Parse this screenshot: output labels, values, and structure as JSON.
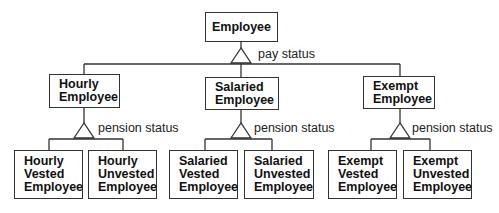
{
  "diagram": {
    "type": "generalization-hierarchy",
    "root": {
      "label_lines": [
        "Employee"
      ],
      "discriminator": "pay status"
    },
    "level1": [
      {
        "label_lines": [
          "Hourly",
          "Employee"
        ],
        "discriminator": "pension status",
        "children": [
          {
            "label_lines": [
              "Hourly",
              "Vested",
              "Employee"
            ]
          },
          {
            "label_lines": [
              "Hourly",
              "Unvested",
              "Employee"
            ]
          }
        ]
      },
      {
        "label_lines": [
          "Salaried",
          "Employee"
        ],
        "discriminator": "pension status",
        "children": [
          {
            "label_lines": [
              "Salaried",
              "Vested",
              "Employee"
            ]
          },
          {
            "label_lines": [
              "Salaried",
              "Unvested",
              "Employee"
            ]
          }
        ]
      },
      {
        "label_lines": [
          "Exempt",
          "Employee"
        ],
        "discriminator": "pension status",
        "children": [
          {
            "label_lines": [
              "Exempt",
              "Vested",
              "Employee"
            ]
          },
          {
            "label_lines": [
              "Exempt",
              "Unvested",
              "Employee"
            ]
          }
        ]
      }
    ],
    "colors": {
      "line": "#333333",
      "text": "#111111",
      "background": "#ffffff"
    }
  }
}
